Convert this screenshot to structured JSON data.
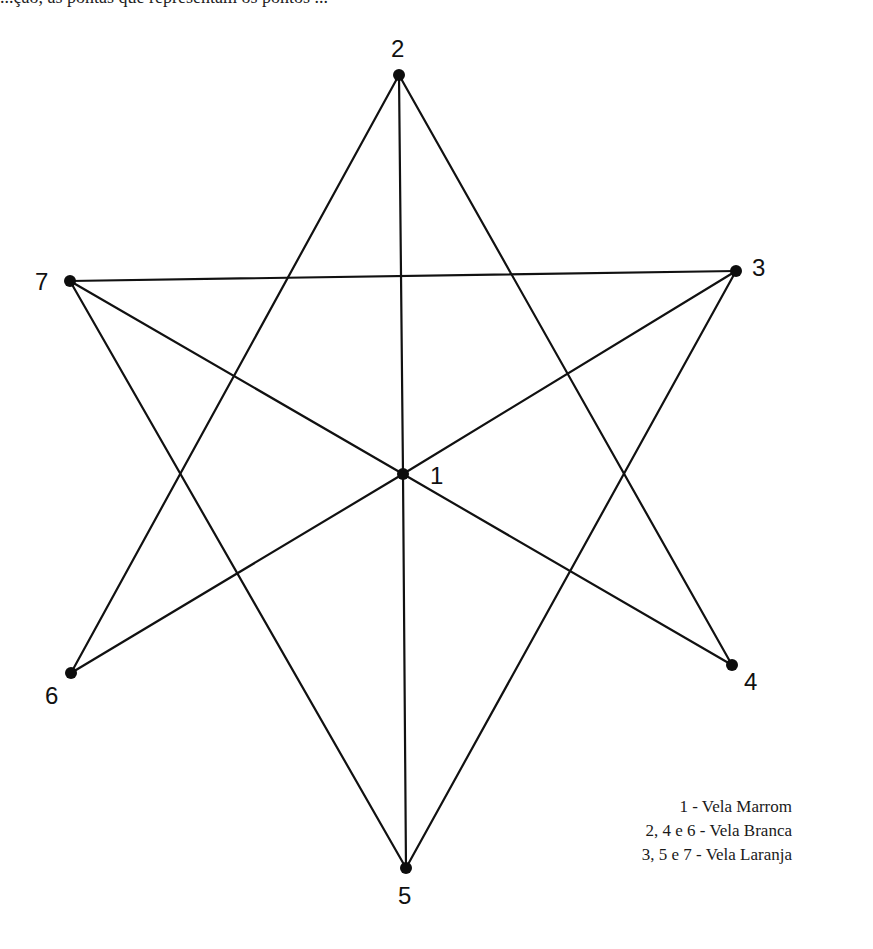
{
  "header": {
    "cut_off_text": "...ção, as pontas que representam os pontos ..."
  },
  "diagram": {
    "nodes": [
      {
        "id": "1",
        "label": "1",
        "x": 403,
        "y": 474,
        "lx": 430,
        "ly": 484
      },
      {
        "id": "2",
        "label": "2",
        "x": 399,
        "y": 75,
        "lx": 391,
        "ly": 57
      },
      {
        "id": "3",
        "label": "3",
        "x": 736,
        "y": 271,
        "lx": 752,
        "ly": 276
      },
      {
        "id": "4",
        "label": "4",
        "x": 732,
        "y": 665,
        "lx": 744,
        "ly": 690
      },
      {
        "id": "5",
        "label": "5",
        "x": 406,
        "y": 868,
        "lx": 398,
        "ly": 904
      },
      {
        "id": "6",
        "label": "6",
        "x": 71,
        "y": 673,
        "lx": 45,
        "ly": 704
      },
      {
        "id": "7",
        "label": "7",
        "x": 70,
        "y": 281,
        "lx": 35,
        "ly": 290
      }
    ],
    "edges": [
      [
        "2",
        "6"
      ],
      [
        "2",
        "1"
      ],
      [
        "2",
        "4"
      ],
      [
        "7",
        "3"
      ],
      [
        "7",
        "1"
      ],
      [
        "7",
        "5"
      ],
      [
        "3",
        "1"
      ],
      [
        "3",
        "5"
      ],
      [
        "1",
        "6"
      ],
      [
        "1",
        "4"
      ],
      [
        "1",
        "5"
      ]
    ]
  },
  "legend": {
    "items": [
      "1 - Vela Marrom",
      "2, 4 e 6 - Vela Branca",
      "3, 5 e 7 - Vela Laranja"
    ]
  }
}
